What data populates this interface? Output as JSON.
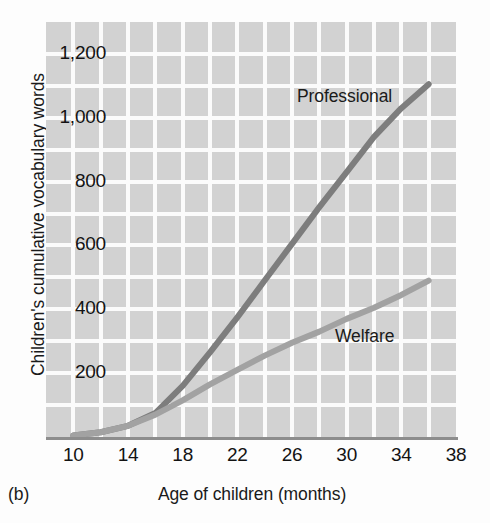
{
  "figure": {
    "panel_caption": "(b)",
    "x_axis_title": "Age of children (months)",
    "y_axis_title": "Children's cumulative vocabulary words"
  },
  "chart_data": {
    "type": "line",
    "title": "",
    "subtitle": "",
    "xlabel": "Age of children (months)",
    "ylabel": "Children's cumulative vocabulary words",
    "xlim": [
      8,
      38
    ],
    "ylim": [
      0,
      1300
    ],
    "grid": true,
    "legend_position": "inline-annotation",
    "x_tick_labels": [
      "10",
      "14",
      "18",
      "22",
      "26",
      "30",
      "34",
      "38"
    ],
    "x_ticks": [
      10,
      14,
      18,
      22,
      26,
      30,
      34,
      38
    ],
    "y_tick_labels": [
      "200",
      "400",
      "600",
      "800",
      "1,000",
      "1,200"
    ],
    "y_ticks": [
      200,
      400,
      600,
      800,
      1000,
      1200
    ],
    "x": [
      10,
      12,
      14,
      16,
      18,
      20,
      22,
      24,
      26,
      28,
      30,
      32,
      34,
      36
    ],
    "series": [
      {
        "name": "Professional",
        "color": "#7d7d7d",
        "values": [
          5,
          15,
          35,
          75,
          160,
          265,
          375,
          490,
          605,
          720,
          830,
          940,
          1030,
          1105
        ]
      },
      {
        "name": "Welfare",
        "color": "#a2a2a2",
        "values": [
          5,
          15,
          35,
          70,
          115,
          165,
          210,
          255,
          295,
          330,
          370,
          405,
          445,
          490
        ]
      }
    ],
    "annotations": [
      {
        "text": "Professional",
        "x": 25,
        "y": 1170
      },
      {
        "text": "Welfare",
        "x": 31,
        "y": 360
      }
    ],
    "colors": {
      "plot_background": "#d2d2d2",
      "gridline": "#fbfbfb",
      "axis_line": "#8d8d8d",
      "page_background": "#fdfdfd",
      "text": "#1a1a1a"
    }
  }
}
